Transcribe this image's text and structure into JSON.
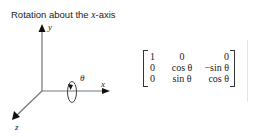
{
  "title": {
    "prefix": "Rotation about the ",
    "axis_var": "x",
    "suffix": "-axis"
  },
  "diagram": {
    "axis_labels": {
      "x": "x",
      "y": "y",
      "z": "z"
    },
    "rotation_label": "θ",
    "colors": {
      "axis": "#777777",
      "arrowhead": "#111111"
    }
  },
  "matrix": {
    "rows": [
      [
        "1",
        "0",
        "0"
      ],
      [
        "0",
        "cos θ",
        "−sin θ"
      ],
      [
        "0",
        "sin θ",
        "cos θ"
      ]
    ]
  }
}
